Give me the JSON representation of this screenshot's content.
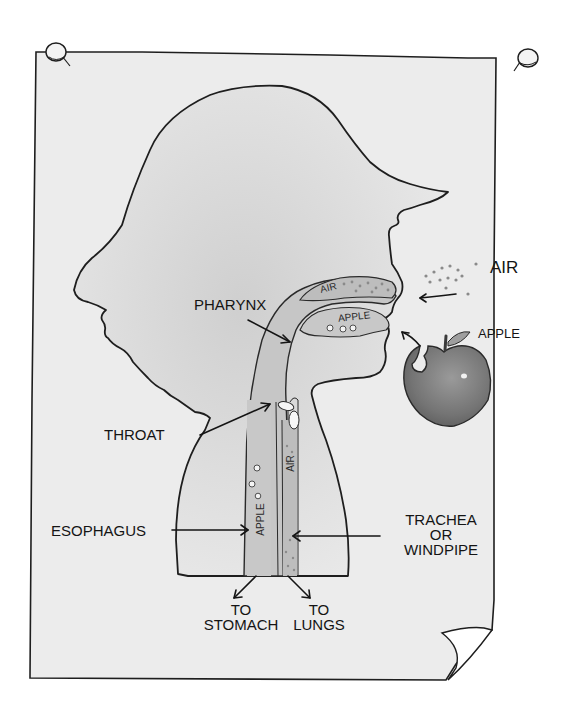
{
  "diagram": {
    "style": "watercolor sketch on pinned paper"
  },
  "labels": {
    "air_outside": "AIR",
    "apple_outside": "APPLE",
    "pharynx": "PHARYNX",
    "throat": "THROAT",
    "esophagus": "ESOPHAGUS",
    "trachea_line1": "TRACHEA",
    "trachea_line2": "OR",
    "trachea_line3": "WINDPIPE",
    "to_stomach_line1": "TO",
    "to_stomach_line2": "STOMACH",
    "to_lungs_line1": "TO",
    "to_lungs_line2": "LUNGS"
  },
  "inner_labels": {
    "nasal_air": "AIR",
    "mouth_apple": "APPLE",
    "esophagus_apple": "APPLE",
    "trachea_air": "AIR"
  },
  "icons": {
    "pin_left": "pushpin-icon",
    "pin_right": "pushpin-icon",
    "apple": "apple-icon",
    "paper_curl": "page-curl-icon"
  },
  "colors": {
    "paper": "#ececec",
    "outline": "#1e1e1e",
    "head_wash": "#dcdcdc",
    "airway": "#c4c4c4",
    "apple": "#7c7c7c",
    "text": "#141414"
  }
}
